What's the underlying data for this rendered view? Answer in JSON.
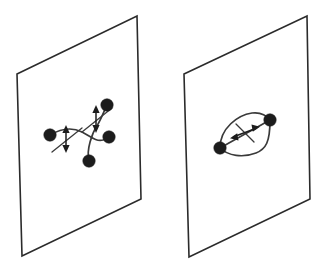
{
  "figure": {
    "background_color": "#ffffff",
    "line_color": "#3a3a3a",
    "outline_color": "#2b2b2b",
    "node_color": "#1c1c1c",
    "width": 325,
    "height": 267,
    "panels": [
      {
        "id": "left-panel",
        "name": "crossing-strands-plane",
        "plane": {
          "name": "plane-parallelogram-left",
          "corners": [
            {
              "x": 17,
              "y": 74
            },
            {
              "x": 137,
              "y": 16
            },
            {
              "x": 141,
              "y": 199
            },
            {
              "x": 22,
              "y": 256
            }
          ]
        },
        "nodes": [
          {
            "name": "node-left",
            "x": 50,
            "y": 135,
            "r": 6.2
          },
          {
            "name": "node-top-right",
            "x": 107,
            "y": 105,
            "r": 6.2
          },
          {
            "name": "node-right",
            "x": 109,
            "y": 137,
            "r": 6.2
          },
          {
            "name": "node-bottom-left",
            "x": 89,
            "y": 161,
            "r": 6.2
          }
        ],
        "strands": [
          {
            "name": "strand-lower-left-to-upper-right",
            "path": "M 89 161 C 86 150 92 133 98 124 C 102 117 104 111 107 105"
          },
          {
            "name": "strand-left-to-right",
            "path": "M 50 135 C 62 128 72 127 82 132 C 90 136 96 142 103 140 C 106 139 108 138 109 137"
          }
        ],
        "markers": [
          {
            "name": "surgery-marker-lower-left",
            "shaft": {
              "x1": 66,
              "y1": 128,
              "x2": 66,
              "y2": 150
            },
            "cross": {
              "x1": 52,
              "y1": 152,
              "x2": 82,
              "y2": 128
            },
            "arrow_up": "66,125 62.4,133 69.6,133",
            "arrow_down": "66,153 62.4,145 69.6,145"
          },
          {
            "name": "surgery-marker-upper-right",
            "shaft": {
              "x1": 96,
              "y1": 108,
              "x2": 96,
              "y2": 130
            },
            "cross": {
              "x1": 82,
              "y1": 132,
              "x2": 112,
              "y2": 108
            },
            "arrow_up": "96,105 92.4,113 99.6,113",
            "arrow_down": "96,133 92.4,125 99.6,125"
          }
        ]
      },
      {
        "id": "right-panel",
        "name": "bigon-lens-plane",
        "plane": {
          "name": "plane-parallelogram-right",
          "corners": [
            {
              "x": 184,
              "y": 74
            },
            {
              "x": 307,
              "y": 16
            },
            {
              "x": 310,
              "y": 199
            },
            {
              "x": 189,
              "y": 257
            }
          ]
        },
        "nodes": [
          {
            "name": "node-lower-left",
            "x": 220,
            "y": 148,
            "r": 6.2
          },
          {
            "name": "node-upper-right",
            "x": 270,
            "y": 120,
            "r": 6.2
          }
        ],
        "strands": [
          {
            "name": "bigon-arc-upper",
            "path": "M 220 148 C 220 128 238 115 252 113 C 261 112 267 116 270 120"
          },
          {
            "name": "bigon-arc-lower",
            "path": "M 220 148 C 228 156 243 158 256 153 C 266 149 270 142 270 120"
          },
          {
            "name": "bigon-chord",
            "path": "M 220 148 L 270 120"
          }
        ],
        "markers": [
          {
            "name": "surgery-marker-center",
            "shaft": {
              "x1": 233,
              "y1": 137,
              "x2": 257,
              "y2": 128
            },
            "cross": {
              "x1": 236,
              "y1": 124,
              "x2": 254,
              "y2": 142
            },
            "arrow_up": "230,138.2 237.2,133.3 238.5,140.6",
            "arrow_down": "260,126.8 252.8,131.7 251.5,124.4"
          }
        ]
      }
    ]
  }
}
